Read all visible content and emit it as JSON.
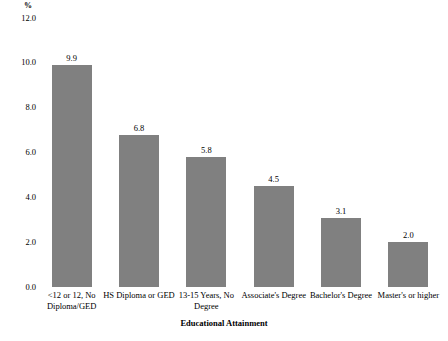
{
  "chart_data": {
    "type": "bar",
    "title": "",
    "subtitle": "",
    "xlabel": "Educational Attainment",
    "ylabel": "%",
    "categories": [
      "<12 or 12, No Diploma/GED",
      "HS Diploma or GED",
      "13-15 Years, No Degree",
      "Associate's Degree",
      "Bachelor's Degree",
      "Master's or higher"
    ],
    "values": [
      9.9,
      6.8,
      5.8,
      4.5,
      3.1,
      2.0
    ],
    "data_labels": [
      "9.9",
      "6.8",
      "5.8",
      "4.5",
      "3.1",
      "2.0"
    ],
    "ylim": [
      0.0,
      12.0
    ],
    "ytick_labels": [
      "12.0",
      "10.0",
      "8.0",
      "6.0",
      "4.0",
      "2.0",
      "0.0"
    ],
    "ytick_values": [
      12.0,
      10.0,
      8.0,
      6.0,
      4.0,
      2.0,
      0.0
    ],
    "grid": false,
    "legend": false,
    "legend_position": "none",
    "bar_color": "#808080",
    "background_color": "#ffffff",
    "text_color": "#000000"
  }
}
